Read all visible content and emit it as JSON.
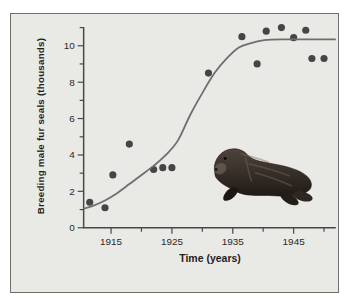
{
  "figure": {
    "background": "#ffffff",
    "panel_background": "#e9e9e5",
    "panel_border": "#6f6f6b"
  },
  "chart_data": {
    "type": "scatter",
    "title": "",
    "xlabel": "Time (years)",
    "ylabel": "Breeding male fur seals (thousands)",
    "xlim": [
      1910.5,
      1952
    ],
    "ylim": [
      0,
      11.8
    ],
    "x_ticks_labeled": [
      1915,
      1925,
      1935,
      1945
    ],
    "x_ticks_minor": [
      1920,
      1930,
      1940,
      1950
    ],
    "y_ticks_labeled": [
      0,
      2,
      4,
      6,
      8,
      10
    ],
    "y_ticks_minor": [
      1,
      3,
      5,
      7,
      9,
      11
    ],
    "grid": false,
    "axis_color": "#474747",
    "tick_label_color": "#2a2a2a",
    "series": [
      {
        "name": "observed-breeding-males",
        "type": "scatter",
        "color": "#454545",
        "points": [
          [
            1911.5,
            1.4
          ],
          [
            1914,
            1.1
          ],
          [
            1915.3,
            2.9
          ],
          [
            1918,
            4.6
          ],
          [
            1922,
            3.2
          ],
          [
            1923.5,
            3.3
          ],
          [
            1925,
            3.3
          ],
          [
            1931,
            8.5
          ],
          [
            1936.5,
            10.5
          ],
          [
            1939,
            9.0
          ],
          [
            1940.5,
            10.8
          ],
          [
            1943,
            11.0
          ],
          [
            1945,
            10.45
          ],
          [
            1947,
            10.85
          ],
          [
            1948,
            9.3
          ],
          [
            1950,
            9.3
          ]
        ]
      },
      {
        "name": "logistic-growth-curve",
        "type": "line",
        "color": "#6e6e6e",
        "points": [
          [
            1910.5,
            1.05
          ],
          [
            1912,
            1.2
          ],
          [
            1914,
            1.5
          ],
          [
            1916,
            1.9
          ],
          [
            1918,
            2.4
          ],
          [
            1920,
            2.9
          ],
          [
            1922,
            3.4
          ],
          [
            1924,
            4.0
          ],
          [
            1926,
            4.8
          ],
          [
            1928,
            6.2
          ],
          [
            1930,
            7.4
          ],
          [
            1932,
            8.5
          ],
          [
            1934,
            9.3
          ],
          [
            1936,
            9.9
          ],
          [
            1938,
            10.15
          ],
          [
            1940,
            10.3
          ],
          [
            1943,
            10.35
          ],
          [
            1952,
            10.35
          ]
        ]
      }
    ]
  },
  "illustration": {
    "subject": "northern fur seal",
    "body_color": "#352c25",
    "highlight_color": "#7a6a5b"
  }
}
